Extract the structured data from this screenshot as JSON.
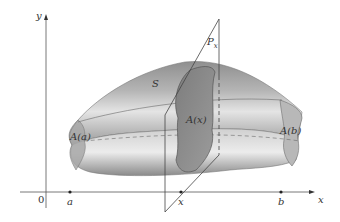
{
  "figure": {
    "labels": {
      "y_axis": "y",
      "x_axis": "x",
      "origin": "0",
      "a": "a",
      "b": "b",
      "x_point": "x",
      "solid": "S",
      "plane": "P",
      "plane_sub": "x",
      "A_a": "A(a)",
      "A_x": "A(x)",
      "A_b": "A(b)"
    },
    "colors": {
      "solid_light": "#d6d6d6",
      "solid_mid": "#9e9e9e",
      "solid_dark": "#7a7a7a",
      "cross_section": "#8c8c8c",
      "axis": "#333333",
      "background": "#ffffff"
    }
  }
}
